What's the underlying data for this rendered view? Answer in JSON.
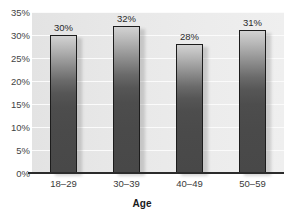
{
  "chart_data": {
    "type": "bar",
    "title": "",
    "categories": [
      "18–29",
      "30–39",
      "40–49",
      "50–59"
    ],
    "values": [
      30,
      32,
      28,
      31
    ],
    "data_labels": [
      "30%",
      "32%",
      "28%",
      "31%"
    ],
    "xlabel": "Age",
    "ylabel": "",
    "ylim": [
      0,
      35
    ],
    "ytick_labels": [
      "35%",
      "30%",
      "25%",
      "20%",
      "15%",
      "10%",
      "5%",
      "0%"
    ],
    "ytick_values": [
      35,
      30,
      25,
      20,
      15,
      10,
      5,
      0
    ],
    "grid": true,
    "legend": false,
    "colors": {
      "bar_top": "#d2d2d2",
      "bar_bottom": "#484848",
      "bar_outline": "#1c1c1c",
      "plot_background": "#e8e8e8",
      "gridline": "#fbfbfb",
      "axis_line": "#2b2b2b",
      "text": "#333333"
    }
  }
}
